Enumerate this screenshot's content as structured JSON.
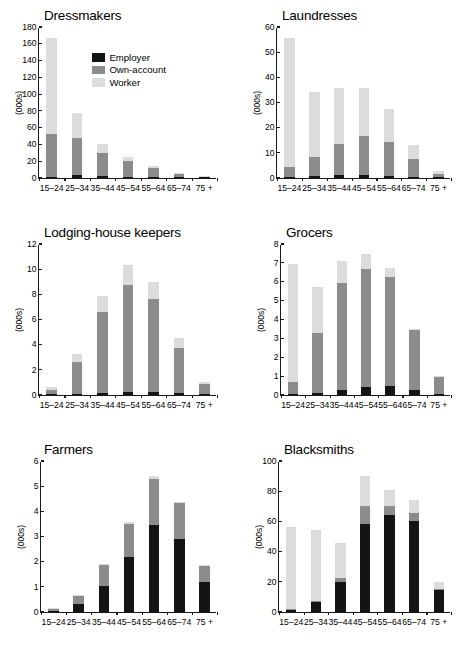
{
  "figure": {
    "width": 468,
    "height": 651,
    "ylabel": "(000s)",
    "categories": [
      "15–24",
      "25–34",
      "35–44",
      "45–54",
      "55–64",
      "65–74",
      "75 +"
    ],
    "colors": {
      "employer": "#141414",
      "own_account": "#8c8c8c",
      "worker": "#dcdcdc",
      "axis": "#1a1a1a",
      "background": "#ffffff"
    },
    "legend": {
      "position": "inside top-left of first panel",
      "entries": [
        {
          "label": "Employer",
          "color": "#141414",
          "key": "employer"
        },
        {
          "label": "Own-account",
          "color": "#8c8c8c",
          "key": "own_account"
        },
        {
          "label": "Worker",
          "color": "#dcdcdc",
          "key": "worker"
        }
      ]
    }
  },
  "chart_data": [
    {
      "type": "bar",
      "title": "Dressmakers",
      "xlabel": "",
      "ylabel": "(000s)",
      "ylim": [
        0,
        180
      ],
      "yticks": [
        0,
        20,
        40,
        60,
        80,
        100,
        120,
        140,
        160,
        180
      ],
      "grid": false,
      "stacked": true,
      "categories": [
        "15–24",
        "25–34",
        "35–44",
        "45–54",
        "55–64",
        "65–74",
        "75 +"
      ],
      "series": [
        {
          "name": "Employer",
          "values": [
            1.5,
            3.0,
            2.6,
            1.6,
            1.0,
            0.4,
            0.1
          ]
        },
        {
          "name": "Own-account",
          "values": [
            51.5,
            45.0,
            27.5,
            18.5,
            11.5,
            4.6,
            1.0
          ]
        },
        {
          "name": "Worker",
          "values": [
            114.0,
            29.0,
            10.5,
            5.0,
            1.5,
            0.8,
            0.4
          ]
        }
      ],
      "totals": [
        167,
        77,
        40.6,
        25.1,
        14,
        5.8,
        1.5
      ]
    },
    {
      "type": "bar",
      "title": "Laundresses",
      "xlabel": "",
      "ylabel": "(000s)",
      "ylim": [
        0,
        60
      ],
      "yticks": [
        0,
        10,
        20,
        30,
        40,
        50,
        60
      ],
      "grid": false,
      "stacked": true,
      "categories": [
        "15–24",
        "25–34",
        "35–44",
        "45–54",
        "55–64",
        "65–74",
        "75 +"
      ],
      "series": [
        {
          "name": "Employer",
          "values": [
            0.5,
            0.8,
            1.0,
            1.1,
            0.7,
            0.3,
            0.05
          ]
        },
        {
          "name": "Own-account",
          "values": [
            3.8,
            7.7,
            12.7,
            15.4,
            13.7,
            7.4,
            1.55
          ]
        },
        {
          "name": "Worker",
          "values": [
            51.4,
            25.8,
            21.9,
            19.2,
            12.9,
            5.5,
            0.9
          ]
        }
      ],
      "totals": [
        55.7,
        34.3,
        35.6,
        35.7,
        27.3,
        13.2,
        2.5
      ]
    },
    {
      "type": "bar",
      "title": "Lodging-house keepers",
      "xlabel": "",
      "ylabel": "(000s)",
      "ylim": [
        0,
        12
      ],
      "yticks": [
        0,
        2,
        4,
        6,
        8,
        10,
        12
      ],
      "grid": false,
      "stacked": true,
      "categories": [
        "15–24",
        "25–34",
        "35–44",
        "45–54",
        "55–64",
        "65–74",
        "75 +"
      ],
      "series": [
        {
          "name": "Employer",
          "values": [
            0.05,
            0.1,
            0.18,
            0.27,
            0.22,
            0.15,
            0.03
          ]
        },
        {
          "name": "Own-account",
          "values": [
            0.35,
            2.5,
            6.45,
            8.45,
            7.45,
            3.6,
            0.82
          ]
        },
        {
          "name": "Worker",
          "values": [
            0.25,
            0.7,
            1.25,
            1.6,
            1.3,
            0.75,
            0.15
          ]
        }
      ],
      "totals": [
        0.65,
        3.3,
        7.88,
        10.32,
        8.97,
        4.5,
        1.0
      ]
    },
    {
      "type": "bar",
      "title": "Grocers",
      "xlabel": "",
      "ylabel": "(000s)",
      "ylim": [
        0,
        8
      ],
      "yticks": [
        0,
        1,
        2,
        3,
        4,
        5,
        6,
        7,
        8
      ],
      "grid": false,
      "stacked": true,
      "categories": [
        "15–24",
        "25–34",
        "35–44",
        "45–54",
        "55–64",
        "65–74",
        "75 +"
      ],
      "series": [
        {
          "name": "Employer",
          "values": [
            0.04,
            0.12,
            0.27,
            0.45,
            0.5,
            0.26,
            0.07
          ]
        },
        {
          "name": "Own-account",
          "values": [
            0.66,
            3.18,
            5.66,
            6.25,
            5.76,
            3.16,
            0.88
          ]
        },
        {
          "name": "Worker",
          "values": [
            6.24,
            2.45,
            1.16,
            0.75,
            0.47,
            0.08,
            0.05
          ]
        }
      ],
      "totals": [
        6.94,
        5.75,
        7.09,
        7.45,
        6.73,
        3.5,
        1.0
      ]
    },
    {
      "type": "bar",
      "title": "Farmers",
      "xlabel": "",
      "ylabel": "(000s)",
      "ylim": [
        0,
        6
      ],
      "yticks": [
        0,
        1,
        2,
        3,
        4,
        5,
        6
      ],
      "grid": false,
      "stacked": true,
      "categories": [
        "15–24",
        "25–34",
        "35–44",
        "45–54",
        "55–64",
        "65–74",
        "75 +"
      ],
      "series": [
        {
          "name": "Employer",
          "values": [
            0.03,
            0.3,
            1.02,
            2.2,
            3.45,
            2.9,
            1.2
          ]
        },
        {
          "name": "Own-account",
          "values": [
            0.1,
            0.33,
            0.84,
            1.28,
            1.85,
            1.44,
            0.63
          ]
        },
        {
          "name": "Worker",
          "values": [
            0.02,
            0.03,
            0.06,
            0.08,
            0.1,
            0.03,
            0.02
          ]
        }
      ],
      "totals": [
        0.15,
        0.66,
        1.92,
        3.56,
        5.4,
        4.37,
        1.85
      ]
    },
    {
      "type": "bar",
      "title": "Blacksmiths",
      "xlabel": "",
      "ylabel": "(000s)",
      "ylim": [
        0,
        100
      ],
      "yticks": [
        0,
        20,
        40,
        60,
        80,
        100
      ],
      "grid": false,
      "stacked": true,
      "categories": [
        "15–24",
        "25–34",
        "35–44",
        "45–54",
        "55–64",
        "65–74",
        "75 +"
      ],
      "series": [
        {
          "name": "Employer",
          "values": [
            1.5,
            6.8,
            19.8,
            58.0,
            64.0,
            60.5,
            14.5
          ]
        },
        {
          "name": "Own-account",
          "values": [
            0.6,
            0.6,
            3.0,
            12.5,
            6.5,
            5.0,
            1.0
          ]
        },
        {
          "name": "Worker",
          "values": [
            54.5,
            46.6,
            23.0,
            19.5,
            10.5,
            8.5,
            4.5
          ]
        }
      ],
      "totals": [
        56.6,
        54.0,
        45.8,
        90.0,
        81.0,
        74.0,
        20.0
      ]
    }
  ]
}
